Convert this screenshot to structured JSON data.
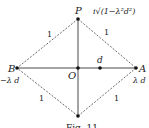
{
  "diagram": {
    "points": {
      "P": {
        "label": "P",
        "expr": "i√(1−λ²d²)"
      },
      "B": {
        "label": "B",
        "expr": "−λ d"
      },
      "A": {
        "label": "A",
        "expr": "λ d"
      },
      "O": {
        "label": "O"
      },
      "D": {
        "label": "d"
      }
    },
    "edge_labels": {
      "top_left": "1",
      "top_right": "1",
      "bottom_left": "1",
      "bottom_right": "1"
    },
    "caption": "Fig. 11"
  }
}
